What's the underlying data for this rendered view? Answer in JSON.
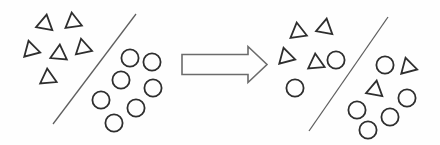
{
  "canvas": {
    "width": 440,
    "height": 145,
    "background": "#fefefe"
  },
  "style": {
    "shape_stroke_color": "#2e2e2e",
    "shape_stroke_width": 1.8,
    "shape_fill": "none",
    "line_stroke_color": "#5f5f5f",
    "line_stroke_width": 1.3,
    "arrow_stroke_color": "#6b6b6b",
    "arrow_stroke_width": 1.6,
    "arrow_fill": "#fefefe",
    "triangle_size": 16.5,
    "circle_radius": 8.6
  },
  "panels": [
    {
      "id": "left-scatter",
      "separator_line": {
        "x1": 136,
        "y1": 14,
        "x2": 53,
        "y2": 124
      },
      "shapes": [
        {
          "type": "triangle",
          "x": 45,
          "y": 24,
          "rotation": 10
        },
        {
          "type": "triangle",
          "x": 73,
          "y": 22,
          "rotation": -8
        },
        {
          "type": "triangle",
          "x": 31,
          "y": 50,
          "rotation": -15
        },
        {
          "type": "triangle",
          "x": 59,
          "y": 54,
          "rotation": 5
        },
        {
          "type": "triangle",
          "x": 83,
          "y": 48,
          "rotation": -12
        },
        {
          "type": "triangle",
          "x": 48,
          "y": 78,
          "rotation": -5
        },
        {
          "type": "circle",
          "x": 130,
          "y": 58
        },
        {
          "type": "circle",
          "x": 152,
          "y": 62
        },
        {
          "type": "circle",
          "x": 121,
          "y": 80
        },
        {
          "type": "circle",
          "x": 153,
          "y": 88
        },
        {
          "type": "circle",
          "x": 101,
          "y": 100
        },
        {
          "type": "circle",
          "x": 136,
          "y": 108
        },
        {
          "type": "circle",
          "x": 114,
          "y": 123
        }
      ]
    },
    {
      "id": "right-scatter",
      "separator_line": {
        "x1": 388,
        "y1": 17,
        "x2": 309,
        "y2": 131
      },
      "shapes": [
        {
          "type": "triangle",
          "x": 298,
          "y": 32,
          "rotation": -8
        },
        {
          "type": "triangle",
          "x": 325,
          "y": 28,
          "rotation": 10
        },
        {
          "type": "triangle",
          "x": 286,
          "y": 57,
          "rotation": -15
        },
        {
          "type": "triangle",
          "x": 316,
          "y": 63,
          "rotation": -5
        },
        {
          "type": "circle",
          "x": 336,
          "y": 60
        },
        {
          "type": "circle",
          "x": 295,
          "y": 88
        },
        {
          "type": "circle",
          "x": 385,
          "y": 65
        },
        {
          "type": "triangle",
          "x": 408,
          "y": 67,
          "rotation": -15
        },
        {
          "type": "triangle",
          "x": 375,
          "y": 90,
          "rotation": 10
        },
        {
          "type": "circle",
          "x": 407,
          "y": 98
        },
        {
          "type": "circle",
          "x": 357,
          "y": 110
        },
        {
          "type": "circle",
          "x": 390,
          "y": 117
        },
        {
          "type": "circle",
          "x": 368,
          "y": 130
        }
      ]
    }
  ],
  "arrow": {
    "points": "182,54.5 248,54.5 248,46.5 267,64.5 248,82.5 248,74.5 182,74.5"
  }
}
